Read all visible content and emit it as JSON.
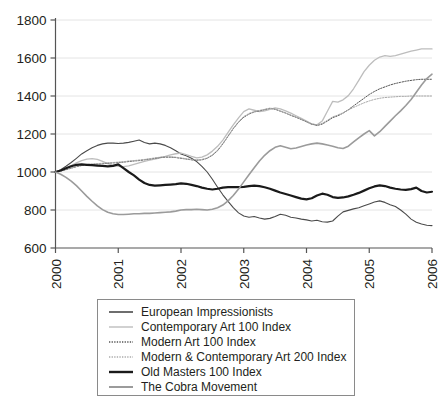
{
  "chart_data": {
    "type": "line",
    "title": "",
    "xlabel": "",
    "ylabel": "",
    "xlim": [
      2000,
      2006
    ],
    "ylim": [
      600,
      1800
    ],
    "yticks": [
      600,
      800,
      1000,
      1200,
      1400,
      1600,
      1800
    ],
    "xticks": [
      "2000",
      "2001",
      "2002",
      "2003",
      "2004",
      "2005",
      "2006"
    ],
    "grid": true,
    "legend_position": "bottom",
    "x": [
      2000,
      2000.083,
      2000.167,
      2000.25,
      2000.333,
      2000.417,
      2000.5,
      2000.583,
      2000.667,
      2000.75,
      2000.833,
      2000.917,
      2001,
      2001.083,
      2001.167,
      2001.25,
      2001.333,
      2001.417,
      2001.5,
      2001.583,
      2001.667,
      2001.75,
      2001.833,
      2001.917,
      2002,
      2002.083,
      2002.167,
      2002.25,
      2002.333,
      2002.417,
      2002.5,
      2002.583,
      2002.667,
      2002.75,
      2002.833,
      2002.917,
      2003,
      2003.083,
      2003.167,
      2003.25,
      2003.333,
      2003.417,
      2003.5,
      2003.583,
      2003.667,
      2003.75,
      2003.833,
      2003.917,
      2004,
      2004.083,
      2004.167,
      2004.25,
      2004.333,
      2004.417,
      2004.5,
      2004.583,
      2004.667,
      2004.75,
      2004.833,
      2004.917,
      2005,
      2005.083,
      2005.167,
      2005.25,
      2005.333,
      2005.417,
      2005.5,
      2005.583,
      2005.667,
      2005.75,
      2005.833,
      2005.917,
      2006
    ],
    "series": [
      {
        "name": "European Impressionists",
        "color": "#4a4a4a",
        "width": 1.1,
        "dash": "none",
        "values": [
          1000,
          1012,
          1030,
          1050,
          1072,
          1095,
          1112,
          1128,
          1140,
          1148,
          1152,
          1152,
          1150,
          1152,
          1156,
          1162,
          1168,
          1155,
          1148,
          1152,
          1148,
          1140,
          1128,
          1112,
          1095,
          1085,
          1072,
          1055,
          1030,
          1000,
          962,
          920,
          880,
          845,
          812,
          785,
          768,
          762,
          766,
          758,
          752,
          756,
          766,
          778,
          772,
          762,
          758,
          752,
          748,
          742,
          746,
          738,
          736,
          742,
          768,
          790,
          798,
          806,
          812,
          822,
          832,
          842,
          848,
          840,
          828,
          818,
          800,
          778,
          752,
          736,
          726,
          720,
          718
        ]
      },
      {
        "name": "Contemporary Art 100 Index",
        "color": "#bdbdbd",
        "width": 1.3,
        "dash": "none",
        "values": [
          1000,
          1008,
          1020,
          1034,
          1048,
          1060,
          1068,
          1070,
          1066,
          1056,
          1044,
          1036,
          1030,
          1028,
          1032,
          1040,
          1048,
          1056,
          1062,
          1068,
          1075,
          1082,
          1090,
          1096,
          1100,
          1092,
          1082,
          1074,
          1078,
          1090,
          1110,
          1135,
          1168,
          1208,
          1248,
          1285,
          1318,
          1332,
          1325,
          1318,
          1322,
          1330,
          1338,
          1332,
          1322,
          1310,
          1296,
          1282,
          1268,
          1252,
          1248,
          1268,
          1320,
          1372,
          1368,
          1380,
          1402,
          1438,
          1482,
          1528,
          1562,
          1588,
          1605,
          1612,
          1608,
          1612,
          1620,
          1628,
          1636,
          1642,
          1648,
          1648,
          1648
        ]
      },
      {
        "name": "Modern Art 100 Index",
        "color": "#555555",
        "width": 1.0,
        "dash": "1.4,1.4",
        "values": [
          1000,
          1005,
          1012,
          1020,
          1028,
          1034,
          1038,
          1040,
          1042,
          1044,
          1046,
          1048,
          1050,
          1052,
          1055,
          1058,
          1060,
          1064,
          1068,
          1072,
          1076,
          1078,
          1078,
          1076,
          1072,
          1068,
          1064,
          1062,
          1064,
          1072,
          1088,
          1112,
          1148,
          1188,
          1228,
          1262,
          1288,
          1305,
          1316,
          1322,
          1328,
          1335,
          1330,
          1320,
          1310,
          1298,
          1288,
          1276,
          1264,
          1252,
          1245,
          1252,
          1268,
          1286,
          1296,
          1310,
          1328,
          1348,
          1368,
          1388,
          1408,
          1424,
          1438,
          1448,
          1458,
          1466,
          1472,
          1478,
          1482,
          1486,
          1488,
          1488,
          1488
        ]
      },
      {
        "name": "Modern & Contemporary Art 200 Index",
        "color": "#a8a8a8",
        "width": 1.0,
        "dash": "1.4,1.4",
        "values": [
          1000,
          1006,
          1014,
          1022,
          1030,
          1036,
          1040,
          1042,
          1044,
          1046,
          1048,
          1050,
          1052,
          1054,
          1058,
          1060,
          1063,
          1066,
          1070,
          1074,
          1078,
          1080,
          1080,
          1078,
          1074,
          1070,
          1066,
          1064,
          1066,
          1074,
          1090,
          1115,
          1150,
          1190,
          1230,
          1265,
          1292,
          1308,
          1318,
          1324,
          1330,
          1336,
          1332,
          1322,
          1312,
          1300,
          1290,
          1278,
          1266,
          1254,
          1248,
          1256,
          1272,
          1290,
          1300,
          1312,
          1326,
          1340,
          1352,
          1364,
          1374,
          1382,
          1388,
          1392,
          1394,
          1396,
          1398,
          1398,
          1400,
          1400,
          1400,
          1400,
          1400
        ]
      },
      {
        "name": "Old Masters 100 Index",
        "color": "#1a1a1a",
        "width": 2.2,
        "dash": "none",
        "values": [
          1000,
          1008,
          1020,
          1030,
          1038,
          1040,
          1038,
          1036,
          1034,
          1032,
          1030,
          1032,
          1040,
          1020,
          1000,
          982,
          960,
          942,
          932,
          928,
          930,
          932,
          934,
          936,
          940,
          938,
          932,
          926,
          918,
          912,
          908,
          912,
          918,
          920,
          920,
          920,
          922,
          926,
          928,
          926,
          920,
          912,
          902,
          892,
          884,
          876,
          868,
          860,
          856,
          862,
          876,
          886,
          880,
          868,
          864,
          866,
          872,
          880,
          890,
          902,
          914,
          924,
          930,
          926,
          918,
          912,
          908,
          906,
          910,
          918,
          900,
          892,
          896
        ]
      },
      {
        "name": "The Cobra Movement",
        "color": "#9b9b9b",
        "width": 1.6,
        "dash": "none",
        "values": [
          1000,
          988,
          972,
          952,
          928,
          900,
          872,
          846,
          822,
          802,
          788,
          780,
          776,
          776,
          778,
          780,
          780,
          782,
          782,
          784,
          786,
          788,
          790,
          794,
          800,
          802,
          802,
          804,
          802,
          800,
          804,
          812,
          826,
          848,
          876,
          910,
          948,
          986,
          1022,
          1058,
          1088,
          1112,
          1130,
          1138,
          1130,
          1122,
          1126,
          1134,
          1142,
          1148,
          1152,
          1148,
          1142,
          1136,
          1128,
          1124,
          1136,
          1158,
          1180,
          1200,
          1218,
          1190,
          1212,
          1240,
          1268,
          1296,
          1322,
          1350,
          1382,
          1420,
          1458,
          1492,
          1515
        ]
      }
    ]
  },
  "legend": {
    "items": [
      {
        "label": "European Impressionists",
        "style": "thin-dark",
        "color": "#4a4a4a",
        "width": 1.6,
        "dash": "none"
      },
      {
        "label": "Contemporary Art 100 Index",
        "style": "thin-light",
        "color": "#bdbdbd",
        "width": 1.4,
        "dash": "none"
      },
      {
        "label": "Modern Art 100 Index",
        "style": "dotted-dark",
        "color": "#555555",
        "width": 1.3,
        "dash": "1.3,1.3"
      },
      {
        "label": "Modern & Contemporary Art 200 Index",
        "style": "dotted-light",
        "color": "#aaaaaa",
        "width": 1.3,
        "dash": "1.3,1.3"
      },
      {
        "label": "Old Masters 100 Index",
        "style": "thick-black",
        "color": "#1a1a1a",
        "width": 2.4,
        "dash": "none"
      },
      {
        "label": "The Cobra Movement",
        "style": "medium-gray",
        "color": "#9b9b9b",
        "width": 2.0,
        "dash": "none"
      }
    ]
  },
  "axes": {
    "y_tick_labels": [
      "1800",
      "1600",
      "1400",
      "1200",
      "1000",
      "800",
      "600"
    ],
    "x_tick_labels": [
      "2000",
      "2001",
      "2002",
      "2003",
      "2004",
      "2005",
      "2006"
    ]
  },
  "colors": {
    "gridline": "#e4e4e4",
    "axis": "#555555",
    "text": "#231f20",
    "legend_border": "#8a8a8a"
  }
}
